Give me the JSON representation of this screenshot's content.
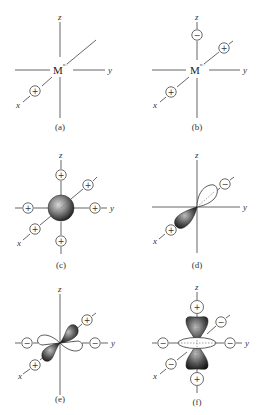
{
  "figure": {
    "panels": [
      {
        "id": "a",
        "caption": "(a)",
        "center_label": "M",
        "center_superscript": "n+",
        "axis_labels": {
          "x": "x",
          "y": "y",
          "z": "z"
        },
        "ligands": [
          {
            "position": "+x",
            "sign": "+"
          }
        ]
      },
      {
        "id": "b",
        "caption": "(b)",
        "center_label": "M",
        "center_superscript": "n+",
        "axis_labels": {
          "x": "x",
          "y": "y",
          "z": "z"
        },
        "ligands": [
          {
            "position": "+z",
            "sign": "−"
          },
          {
            "position": "-x",
            "sign": "+"
          },
          {
            "position": "+x",
            "sign": "+"
          }
        ]
      },
      {
        "id": "c",
        "caption": "(c)",
        "orbital": "s",
        "axis_labels": {
          "x": "x",
          "y": "y",
          "z": "z"
        },
        "ligands": [
          {
            "position": "+z",
            "sign": "+"
          },
          {
            "position": "-z",
            "sign": "+"
          },
          {
            "position": "+y",
            "sign": "+"
          },
          {
            "position": "-y",
            "sign": "+"
          },
          {
            "position": "+x",
            "sign": "+"
          },
          {
            "position": "-x",
            "sign": "+"
          }
        ]
      },
      {
        "id": "d",
        "caption": "(d)",
        "orbital": "px",
        "axis_labels": {
          "x": "x",
          "y": "y",
          "z": "z"
        },
        "ligands": [
          {
            "position": "+x",
            "sign": "+"
          },
          {
            "position": "-x",
            "sign": "−"
          }
        ]
      },
      {
        "id": "e",
        "caption": "(e)",
        "orbital": "dxy",
        "axis_labels": {
          "x": "x",
          "y": "y",
          "z": "z"
        },
        "ligands": [
          {
            "position": "+x",
            "sign": "+"
          },
          {
            "position": "-x",
            "sign": "+"
          },
          {
            "position": "+y",
            "sign": "−"
          },
          {
            "position": "-y",
            "sign": "−"
          }
        ]
      },
      {
        "id": "f",
        "caption": "(f)",
        "orbital": "dz2",
        "axis_labels": {
          "x": "x",
          "y": "y",
          "z": "z"
        },
        "ligands": [
          {
            "position": "+z",
            "sign": "+"
          },
          {
            "position": "-z",
            "sign": "+"
          },
          {
            "position": "+y",
            "sign": "−"
          },
          {
            "position": "-y",
            "sign": "−"
          },
          {
            "position": "+x",
            "sign": "−"
          },
          {
            "position": "-x",
            "sign": "−"
          }
        ]
      }
    ]
  }
}
